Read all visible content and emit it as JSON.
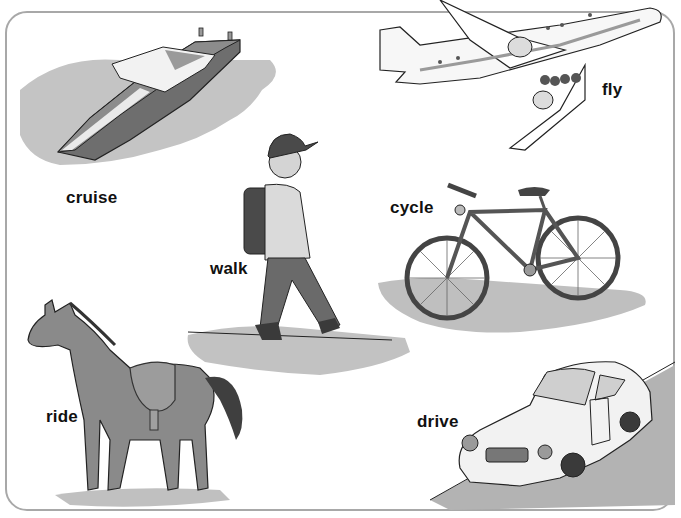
{
  "worksheet": {
    "topic": "ways to travel",
    "items": [
      {
        "verb": "cruise",
        "picture": "motor-boat"
      },
      {
        "verb": "fly",
        "picture": "airplane"
      },
      {
        "verb": "walk",
        "picture": "boy-with-backpack"
      },
      {
        "verb": "cycle",
        "picture": "bicycle"
      },
      {
        "verb": "ride",
        "picture": "horse-with-saddle"
      },
      {
        "verb": "drive",
        "picture": "sports-car"
      }
    ]
  },
  "colors": {
    "border": "#a8a8a8",
    "ink": "#111111",
    "shadow": "#bdbdbd",
    "dark_fill": "#6a6a6a",
    "mid_fill": "#8a8a8a"
  }
}
